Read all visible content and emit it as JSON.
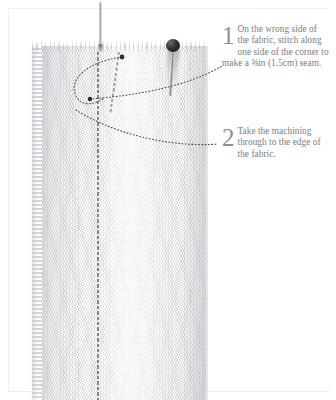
{
  "page": {
    "background_color": "#ffffff"
  },
  "photo": {
    "alt_name": "fabric-with-stitched-seam-photo",
    "elements": {
      "fabric_label": "fabric",
      "needle_label": "sewing-needle",
      "pin_label": "dressmaker-pin",
      "stitch_line_label": "machine-stitch-line"
    }
  },
  "captions": [
    {
      "number": "1",
      "text": "On the wrong side of the fabric, stitch along one side of the corner to make a ⅝in (1.5cm) seam.",
      "color": "#7c7e82"
    },
    {
      "number": "2",
      "text": "Take the machining through to the edge of the fabric.",
      "color": "#7c7e82"
    }
  ],
  "colors": {
    "caption_text": "#7c7e82",
    "caption_number": "#8e9094",
    "leader_line": "#4b4d51",
    "pin_head": "#171819",
    "fabric_base": "#fafafa",
    "border": "#f0f0f0"
  }
}
